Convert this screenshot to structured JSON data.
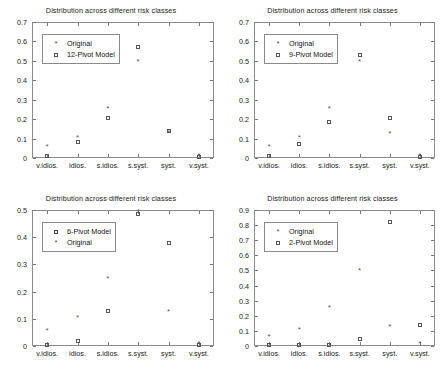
{
  "figure": {
    "panel_count": 4,
    "shared_title": "Distribution across different risk classes",
    "categories": [
      "v.idios.",
      "idios.",
      "s.idios.",
      "s.syst.",
      "syst.",
      "v.syst."
    ],
    "series_labels": {
      "original": "Original",
      "pivot12": "12-Pivot Model",
      "pivot9": "9-Pivot Model",
      "pivot6": "6-Pivot Model",
      "pivot2": "2-Pivot Model"
    },
    "markers": {
      "original": "asterisk-marker",
      "model": "square-marker"
    },
    "colors": {
      "axis": "#8a8a8a",
      "marker": "#555555",
      "text": "#222222",
      "background": "#ffffff"
    }
  },
  "chart_data": [
    {
      "id": "top-left",
      "type": "scatter",
      "title": "Distribution across different risk classes",
      "xlabel": "",
      "ylabel": "",
      "categories": [
        "v.idios.",
        "idios.",
        "s.idios.",
        "s.syst.",
        "syst.",
        "v.syst."
      ],
      "ylim": [
        0,
        0.7
      ],
      "yticks": [
        0,
        0.1,
        0.2,
        0.3,
        0.4,
        0.5,
        0.6,
        0.7
      ],
      "ytick_labels": [
        "0",
        "0.1",
        "0.2",
        "0.3",
        "0.4",
        "0.5",
        "0.6",
        "0.7"
      ],
      "grid": false,
      "legend_position": "upper-left",
      "series": [
        {
          "name": "Original",
          "marker": "asterisk",
          "values": [
            0.05,
            0.1,
            0.245,
            0.49,
            0.125,
            0.005
          ]
        },
        {
          "name": "12-Pivot Model",
          "marker": "square",
          "values": [
            0.01,
            0.08,
            0.205,
            0.57,
            0.14,
            0.005
          ]
        }
      ]
    },
    {
      "id": "top-right",
      "type": "scatter",
      "title": "Distribution across different risk classes",
      "xlabel": "",
      "ylabel": "",
      "categories": [
        "v.idios.",
        "idios.",
        "s.idios.",
        "s.syst.",
        "syst.",
        "v.syst."
      ],
      "ylim": [
        0,
        0.7
      ],
      "yticks": [
        0,
        0.1,
        0.2,
        0.3,
        0.4,
        0.5,
        0.6,
        0.7
      ],
      "ytick_labels": [
        "0",
        "0.1",
        "0.2",
        "0.3",
        "0.4",
        "0.5",
        "0.6",
        "0.7"
      ],
      "grid": false,
      "legend_position": "upper-left",
      "series": [
        {
          "name": "Original",
          "marker": "asterisk",
          "values": [
            0.05,
            0.1,
            0.245,
            0.49,
            0.12,
            0.005
          ]
        },
        {
          "name": "9-Pivot Model",
          "marker": "square",
          "values": [
            0.01,
            0.072,
            0.187,
            0.53,
            0.207,
            0.005
          ]
        }
      ]
    },
    {
      "id": "bottom-left",
      "type": "scatter",
      "title": "Distribution across different risk classes",
      "xlabel": "",
      "ylabel": "",
      "categories": [
        "v.idios.",
        "idios.",
        "s.idios.",
        "s.syst.",
        "syst.",
        "v.syst."
      ],
      "ylim": [
        0,
        0.5
      ],
      "yticks": [
        0,
        0.1,
        0.2,
        0.3,
        0.4,
        0.5
      ],
      "ytick_labels": [
        "0",
        "0.1",
        "0.2",
        "0.3",
        "0.4",
        "0.5"
      ],
      "grid": false,
      "legend_position": "upper-left",
      "series": [
        {
          "name": "6-Pivot Model",
          "marker": "square",
          "values": [
            0.005,
            0.018,
            0.128,
            0.487,
            0.377,
            0.005
          ]
        },
        {
          "name": "Original",
          "marker": "asterisk",
          "values": [
            0.05,
            0.1,
            0.243,
            0.49,
            0.12,
            0.005
          ]
        }
      ]
    },
    {
      "id": "bottom-right",
      "type": "scatter",
      "title": "Distribution across different risk classes",
      "xlabel": "",
      "ylabel": "",
      "categories": [
        "v.idios.",
        "idios.",
        "s.idios.",
        "s.syst.",
        "syst.",
        "v.syst."
      ],
      "ylim": [
        0,
        0.9
      ],
      "yticks": [
        0,
        0.1,
        0.2,
        0.3,
        0.4,
        0.5,
        0.6,
        0.7,
        0.8,
        0.9
      ],
      "ytick_labels": [
        "0",
        "0.1",
        "0.2",
        "0.3",
        "0.4",
        "0.5",
        "0.6",
        "0.7",
        "0.8",
        "0.9"
      ],
      "grid": false,
      "legend_position": "upper-left",
      "series": [
        {
          "name": "Original",
          "marker": "asterisk",
          "values": [
            0.05,
            0.1,
            0.243,
            0.49,
            0.12,
            0.005
          ]
        },
        {
          "name": "2-Pivot Model",
          "marker": "square",
          "values": [
            0.005,
            0.005,
            0.005,
            0.047,
            0.822,
            0.138
          ]
        }
      ]
    }
  ]
}
